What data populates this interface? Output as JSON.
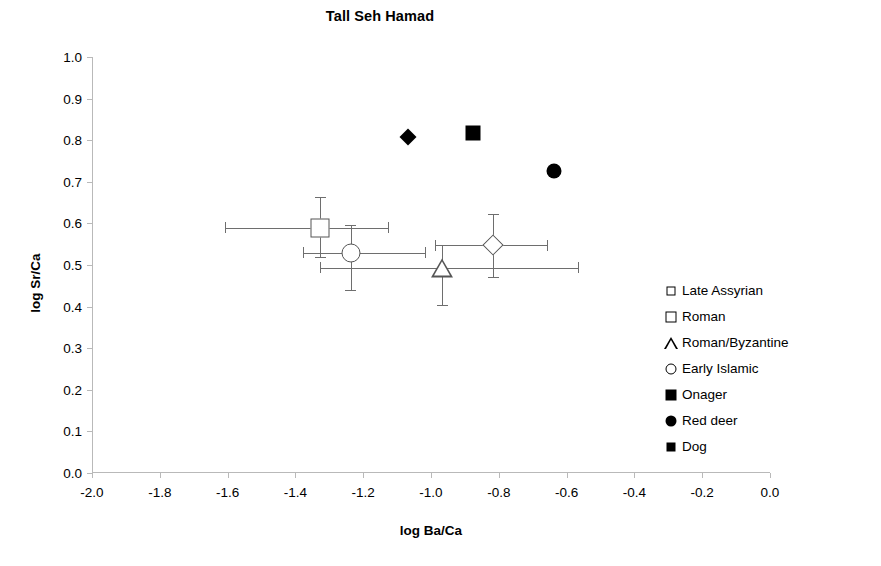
{
  "chart_data": {
    "type": "scatter",
    "title": "Tall Seh Hamad",
    "xlabel": "log Ba/Ca",
    "ylabel": "log Sr/Ca",
    "xlim": [
      -2.0,
      0.0
    ],
    "ylim": [
      0.0,
      1.0
    ],
    "xticks": [
      "-2.0",
      "-1.8",
      "-1.6",
      "-1.4",
      "-1.2",
      "-1.0",
      "-0.8",
      "-0.6",
      "-0.4",
      "-0.2",
      "0.0"
    ],
    "yticks": [
      "1.0",
      "0.9",
      "0.8",
      "0.7",
      "0.6",
      "0.5",
      "0.4",
      "0.3",
      "0.2",
      "0.1",
      "0.0"
    ],
    "grid": false,
    "legend_position": "right-inside",
    "series": [
      {
        "name": "Late Assyrian",
        "marker": "diamond-open",
        "x": -0.82,
        "y": 0.548,
        "xerr_low": -0.99,
        "xerr_high": -0.66,
        "yerr_low": 0.471,
        "yerr_high": 0.623
      },
      {
        "name": "Roman",
        "marker": "square-open",
        "x": -1.33,
        "y": 0.589,
        "xerr_low": -1.61,
        "xerr_high": -1.13,
        "yerr_low": 0.519,
        "yerr_high": 0.663
      },
      {
        "name": "Roman/Byzantine",
        "marker": "triangle-open",
        "x": -0.97,
        "y": 0.493,
        "xerr_low": -1.33,
        "xerr_high": -0.57,
        "yerr_low": 0.404,
        "yerr_high": 0.548
      },
      {
        "name": "Early Islamic",
        "marker": "circle-open",
        "x": -1.24,
        "y": 0.529,
        "xerr_low": -1.38,
        "xerr_high": -1.02,
        "yerr_low": 0.44,
        "yerr_high": 0.596
      },
      {
        "name": "Onager",
        "marker": "square-fill",
        "x": -0.88,
        "y": 0.817
      },
      {
        "name": "Red deer",
        "marker": "circle-fill",
        "x": -0.64,
        "y": 0.726
      },
      {
        "name": "Dog",
        "marker": "diamond-fill",
        "x": -1.07,
        "y": 0.808
      }
    ]
  },
  "legend": {
    "items": [
      {
        "label": "Late Assyrian",
        "marker": "diamond-open"
      },
      {
        "label": "Roman",
        "marker": "square-open"
      },
      {
        "label": "Roman/Byzantine",
        "marker": "triangle-open"
      },
      {
        "label": "Early Islamic",
        "marker": "circle-open"
      },
      {
        "label": "Onager",
        "marker": "square-fill"
      },
      {
        "label": "Red deer",
        "marker": "circle-fill"
      },
      {
        "label": "Dog",
        "marker": "diamond-fill"
      }
    ]
  },
  "colors": {
    "marker_outline": "#555555",
    "marker_fill": "#000000",
    "errorbar": "#6e6e6e",
    "axis": "#b9b9b9",
    "background": "#ffffff",
    "text": "#000000"
  }
}
